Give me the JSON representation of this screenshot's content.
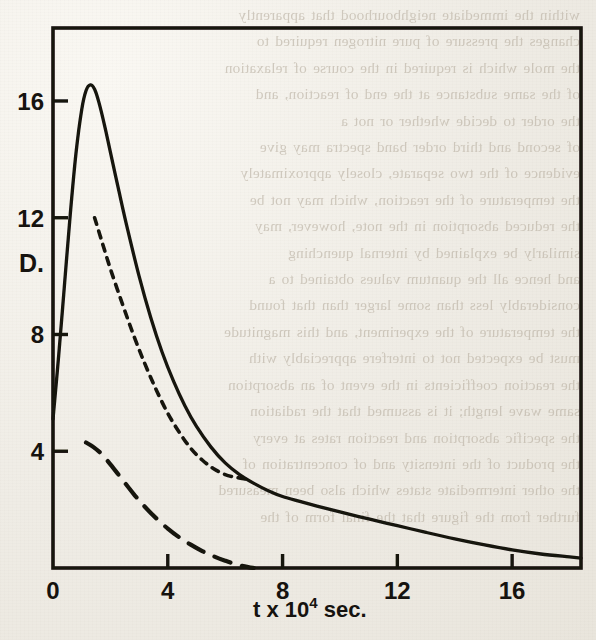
{
  "page": {
    "background_color": "#efece5",
    "ink_color": "#16130f",
    "bleed_through_text": "within the immediate neighbourhood that apparently\nchanges the pressure of pure nitrogen required to\nthe mole which is required in the course of relaxation\nof the same substance at the end of reaction, and\nthe order to decide whether or not a\nof second and third order band spectra may give\nevidence of the two separate, closely approximately\nthe temperature of the reaction, which may not be\nthe reduced absorption in the note, however, may\nsimilarly be explained by internal quenching\nand hence all the quantum values obtained to a\nconsiderably less than some larger than that found\nthe temperature of the experiment, and this magnitude\nmust be expected not to interfere appreciably with\nthe reaction coefficients in the event of an absorption\nsame wave length; it is assumed that the radiation\nthe specific absorption and reaction rates at every\nthe product of the intensity and of concentration of\nthe other intermediate states which also been measured\nfurther from the figure that the final form of the"
  },
  "chart_data": {
    "type": "line",
    "title": "",
    "xlabel": "t x 10⁴ sec.",
    "ylabel": "D.",
    "xlim": [
      0,
      18.4
    ],
    "ylim": [
      0,
      18.5
    ],
    "xticks": [
      0,
      4,
      8,
      12,
      16
    ],
    "xtick_labels": [
      "0",
      "4",
      "8",
      "12",
      "16"
    ],
    "yticks": [
      4,
      8,
      12,
      16
    ],
    "ytick_labels": [
      "4",
      "8",
      "12",
      "16"
    ],
    "grid": false,
    "legend": false,
    "frame": "box",
    "series": [
      {
        "name": "total",
        "style": "solid",
        "points": [
          [
            0.0,
            5.1
          ],
          [
            0.2,
            7.3
          ],
          [
            0.4,
            9.7
          ],
          [
            0.6,
            12.1
          ],
          [
            0.8,
            14.2
          ],
          [
            1.0,
            15.7
          ],
          [
            1.15,
            16.35
          ],
          [
            1.3,
            16.55
          ],
          [
            1.45,
            16.4
          ],
          [
            1.6,
            15.95
          ],
          [
            1.8,
            15.15
          ],
          [
            2.0,
            14.25
          ],
          [
            2.3,
            12.9
          ],
          [
            2.6,
            11.6
          ],
          [
            3.0,
            10.0
          ],
          [
            3.4,
            8.6
          ],
          [
            3.8,
            7.4
          ],
          [
            4.2,
            6.4
          ],
          [
            4.6,
            5.55
          ],
          [
            5.0,
            4.85
          ],
          [
            5.5,
            4.15
          ],
          [
            6.0,
            3.6
          ],
          [
            6.5,
            3.2
          ],
          [
            7.0,
            2.9
          ],
          [
            7.5,
            2.65
          ],
          [
            8.0,
            2.45
          ],
          [
            8.6,
            2.28
          ],
          [
            9.2,
            2.12
          ],
          [
            10.0,
            1.92
          ],
          [
            11.0,
            1.68
          ],
          [
            12.0,
            1.45
          ],
          [
            13.0,
            1.22
          ],
          [
            14.0,
            1.0
          ],
          [
            15.0,
            0.8
          ],
          [
            16.0,
            0.62
          ],
          [
            17.0,
            0.48
          ],
          [
            18.0,
            0.38
          ],
          [
            18.4,
            0.34
          ]
        ]
      },
      {
        "name": "component-a",
        "style": "dotted",
        "points": [
          [
            1.45,
            12.0
          ],
          [
            1.7,
            11.2
          ],
          [
            2.0,
            10.25
          ],
          [
            2.4,
            9.1
          ],
          [
            2.8,
            8.0
          ],
          [
            3.2,
            7.0
          ],
          [
            3.6,
            6.1
          ],
          [
            4.0,
            5.3
          ],
          [
            4.4,
            4.65
          ],
          [
            4.8,
            4.1
          ],
          [
            5.2,
            3.7
          ],
          [
            5.6,
            3.4
          ],
          [
            6.0,
            3.2
          ],
          [
            6.4,
            3.1
          ],
          [
            6.7,
            3.05
          ]
        ]
      },
      {
        "name": "component-b",
        "style": "dashed",
        "points": [
          [
            1.15,
            4.3
          ],
          [
            1.4,
            4.15
          ],
          [
            1.7,
            3.9
          ],
          [
            2.0,
            3.55
          ],
          [
            2.4,
            3.05
          ],
          [
            2.8,
            2.55
          ],
          [
            3.2,
            2.1
          ],
          [
            3.6,
            1.7
          ],
          [
            4.0,
            1.35
          ],
          [
            4.4,
            1.05
          ],
          [
            4.8,
            0.8
          ],
          [
            5.2,
            0.58
          ],
          [
            5.6,
            0.4
          ],
          [
            6.0,
            0.25
          ],
          [
            6.4,
            0.12
          ],
          [
            6.8,
            0.03
          ],
          [
            7.0,
            0.0
          ]
        ]
      }
    ]
  }
}
